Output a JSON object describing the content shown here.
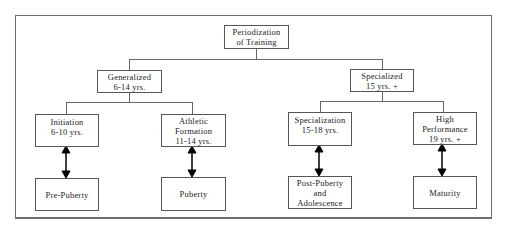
{
  "diagram": {
    "root": {
      "lines": [
        "Periodization",
        "of Training"
      ]
    },
    "level1": [
      {
        "id": "generalized",
        "lines": [
          "Generalized",
          "6-14 yrs."
        ]
      },
      {
        "id": "specialized",
        "lines": [
          "Specialized",
          "15 yrs. +"
        ]
      }
    ],
    "level2": [
      {
        "id": "initiation",
        "lines": [
          "Initiation",
          "6-10 yrs."
        ]
      },
      {
        "id": "athletic-formation",
        "lines": [
          "Athletic",
          "Formation",
          "11-14 yrs."
        ]
      },
      {
        "id": "specialization",
        "lines": [
          "Specialization",
          "15-18 yrs."
        ]
      },
      {
        "id": "high-performance",
        "lines": [
          "High",
          "Performance",
          "19 yrs. +"
        ]
      }
    ],
    "level3": [
      {
        "id": "pre-puberty",
        "lines": [
          "Pre-Puberty"
        ]
      },
      {
        "id": "puberty",
        "lines": [
          "Puberty"
        ]
      },
      {
        "id": "post-puberty",
        "lines": [
          "Post-Puberty",
          "and",
          "Adolescence"
        ]
      },
      {
        "id": "maturity",
        "lines": [
          "Maturity"
        ]
      }
    ],
    "edges": [
      {
        "from": "root",
        "to": "generalized",
        "type": "tree"
      },
      {
        "from": "root",
        "to": "specialized",
        "type": "tree"
      },
      {
        "from": "generalized",
        "to": "initiation",
        "type": "tree"
      },
      {
        "from": "generalized",
        "to": "athletic-formation",
        "type": "tree"
      },
      {
        "from": "specialized",
        "to": "specialization",
        "type": "tree"
      },
      {
        "from": "specialized",
        "to": "high-performance",
        "type": "tree"
      },
      {
        "from": "initiation",
        "to": "pre-puberty",
        "type": "double-arrow"
      },
      {
        "from": "athletic-formation",
        "to": "puberty",
        "type": "double-arrow"
      },
      {
        "from": "specialization",
        "to": "post-puberty",
        "type": "double-arrow"
      },
      {
        "from": "high-performance",
        "to": "maturity",
        "type": "double-arrow"
      }
    ]
  }
}
